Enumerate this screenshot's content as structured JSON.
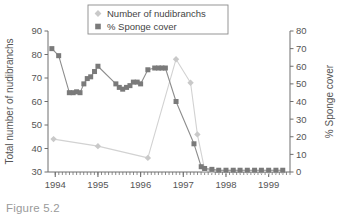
{
  "figure": {
    "caption": "Figure 5.2"
  },
  "chart_data": {
    "type": "line",
    "title": "",
    "xlabel": "",
    "ylabel": "Total number of nudibranchs",
    "y2label": "% Sponge cover",
    "xlim": [
      1993.83,
      1999.5
    ],
    "ylim": [
      30,
      90
    ],
    "y2lim": [
      0,
      80
    ],
    "grid": false,
    "legend_position": "top-center",
    "xticks": [
      "1994",
      "1995",
      "1996",
      "1997",
      "1998",
      "1999"
    ],
    "xtick_values": [
      1994,
      1995,
      1996,
      1997,
      1998,
      1999
    ],
    "yticks": [
      "30",
      "40",
      "50",
      "60",
      "70",
      "80",
      "90"
    ],
    "ytick_values": [
      30,
      40,
      50,
      60,
      70,
      80,
      90
    ],
    "y2ticks": [
      "0",
      "10",
      "20",
      "30",
      "40",
      "50",
      "60",
      "70",
      "80"
    ],
    "y2tick_values": [
      0,
      10,
      20,
      30,
      40,
      50,
      60,
      70,
      80
    ],
    "minor_tick_interval_months": 1,
    "series": [
      {
        "name": "Number of nudibranchs",
        "axis": "left",
        "marker": "diamond",
        "color": "#c9c9c9",
        "line_color": "#d2d2d2",
        "x": [
          1993.96,
          1995.0,
          1996.17,
          1996.83,
          1997.17,
          1997.33,
          1997.5,
          1997.67,
          1997.83,
          1998.0,
          1998.17,
          1998.33,
          1998.5,
          1998.67,
          1998.83,
          1999.0,
          1999.17,
          1999.33
        ],
        "values": [
          44,
          41,
          36,
          78,
          68,
          46,
          31,
          30.5,
          30.5,
          30.4,
          30.4,
          30.4,
          30.3,
          30.3,
          30.3,
          30.3,
          30.2,
          30.2
        ]
      },
      {
        "name": "% Sponge cover",
        "axis": "right",
        "marker": "square",
        "color": "#7a7a7a",
        "line_color": "#8d8d8d",
        "x": [
          1993.92,
          1994.08,
          1994.33,
          1994.42,
          1994.5,
          1994.58,
          1994.67,
          1994.75,
          1994.83,
          1994.92,
          1995.0,
          1995.42,
          1995.5,
          1995.58,
          1995.67,
          1995.75,
          1995.83,
          1995.92,
          1996.0,
          1996.17,
          1996.33,
          1996.42,
          1996.5,
          1996.58,
          1996.83,
          1997.25,
          1997.42,
          1997.5,
          1997.67,
          1997.83,
          1998.0,
          1998.17,
          1998.33,
          1998.5,
          1998.67,
          1998.83,
          1999.0,
          1999.17,
          1999.33
        ],
        "values": [
          70,
          66,
          45,
          45,
          45.5,
          45,
          50,
          53,
          54,
          57,
          60,
          50,
          48,
          47,
          48,
          49,
          51,
          51,
          50,
          58,
          59,
          59,
          59,
          59,
          40,
          16,
          3,
          2,
          1.5,
          1,
          1,
          1,
          1,
          1,
          1,
          1,
          1,
          1,
          1
        ]
      }
    ],
    "legend": [
      {
        "label": "Number of nudibranchs",
        "marker": "diamond",
        "color": "#c9c9c9"
      },
      {
        "label": "% Sponge cover",
        "marker": "square",
        "color": "#7a7a7a"
      }
    ]
  }
}
